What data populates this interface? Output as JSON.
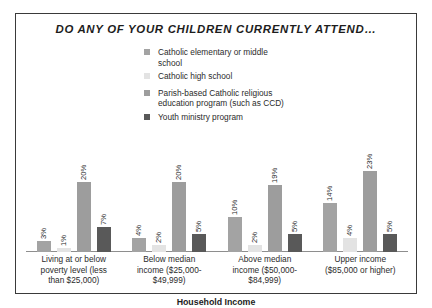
{
  "chart_data": {
    "type": "bar",
    "title": "DO ANY OF YOUR CHILDREN CURRENTLY ATTEND…",
    "xlabel": "Household Income",
    "ylabel": "",
    "ylim": [
      0,
      25
    ],
    "grid": false,
    "legend_position": "top-center",
    "categories": [
      "Living at or below poverty level (less than $25,000)",
      "Below median income ($25,000-$49,999)",
      "Above median income ($50,000-$84,999)",
      "Upper income ($85,000 or higher)"
    ],
    "category_lines": [
      [
        "Living at or below",
        "poverty level (less",
        "than $25,000)"
      ],
      [
        "Below median",
        "income ($25,000-",
        "$49,999)"
      ],
      [
        "Above median",
        "income ($50,000-",
        "$84,999)"
      ],
      [
        "Upper income",
        "($85,000 or higher)"
      ]
    ],
    "series": [
      {
        "name": "Catholic elementary or middle school",
        "name_lines": [
          "Catholic elementary or middle",
          "school"
        ],
        "color": "#a3a3a3",
        "values": [
          3,
          4,
          10,
          14
        ],
        "labels": [
          "3%",
          "4%",
          "10%",
          "14%"
        ]
      },
      {
        "name": "Catholic high school",
        "name_lines": [
          "Catholic high school"
        ],
        "color": "#e3e3e3",
        "values": [
          1,
          2,
          2,
          4
        ],
        "labels": [
          "1%",
          "2%",
          "2%",
          "4%"
        ]
      },
      {
        "name": "Parish-based Catholic religious education program (such as CCD)",
        "name_lines": [
          "Parish-based Catholic religious",
          "education program (such as CCD)"
        ],
        "color": "#9d9d9d",
        "values": [
          20,
          20,
          19,
          23
        ],
        "labels": [
          "20%",
          "20%",
          "19%",
          "23%"
        ]
      },
      {
        "name": "Youth ministry program",
        "name_lines": [
          "Youth ministry program"
        ],
        "color": "#595959",
        "values": [
          7,
          5,
          5,
          5
        ],
        "labels": [
          "7%",
          "5%",
          "5%",
          "5%"
        ]
      }
    ]
  },
  "frame": {
    "border_color": "#3a3a3a",
    "background": "#ffffff"
  }
}
